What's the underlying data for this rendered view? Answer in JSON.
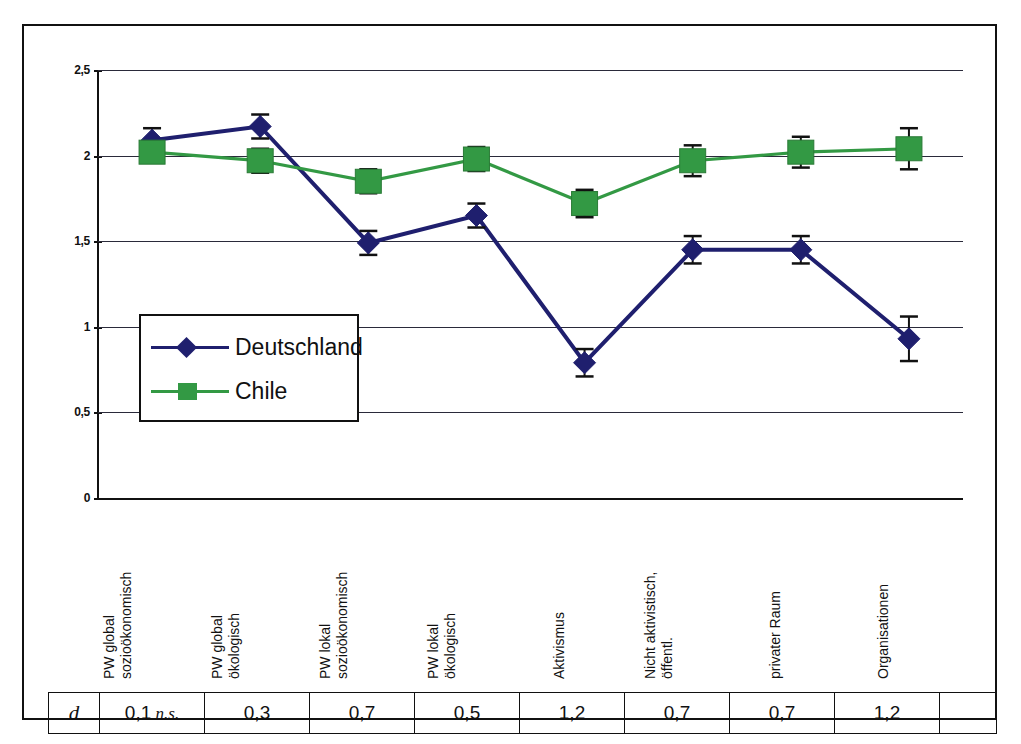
{
  "figure": {
    "background": "#ffffff",
    "frame_color": "#111111"
  },
  "legend": {
    "position": "inside-left-middle",
    "entries": [
      {
        "label": "Deutschland",
        "color": "#1F1F6E",
        "marker": "diamond"
      },
      {
        "label": "Chile",
        "color": "#339944",
        "marker": "square"
      }
    ]
  },
  "d_table": {
    "row_header": "d",
    "cells": [
      "0,1 n.s.",
      "0,3",
      "0,7",
      "0,5",
      "1,2",
      "0,7",
      "0,7",
      "1,2"
    ],
    "cell_values": [
      "0,1",
      "0,3",
      "0,7",
      "0,5",
      "1,2",
      "0,7",
      "0,7",
      "1,2"
    ],
    "cell_notes": [
      "n.s.",
      "",
      "",
      "",
      "",
      "",
      "",
      ""
    ],
    "trailing_empty_cell": ""
  },
  "chart_data": {
    "type": "line",
    "title": "",
    "subtitle": "",
    "xlabel": "",
    "ylabel": "",
    "ylim": [
      0,
      2.5
    ],
    "yticks": [
      0,
      0.5,
      1,
      1.5,
      2,
      2.5
    ],
    "ytick_labels": [
      "0",
      "0,5",
      "1",
      "1,5",
      "2",
      "2,5"
    ],
    "grid": true,
    "legend_position": "inside-left-middle",
    "categories": [
      "PW global sozioökonomisch",
      "PW global ökologisch",
      "PW lokal sozioökonomisch",
      "PW lokal ökologisch",
      "Aktivismus",
      "Nicht aktivistisch, öffentl.",
      "privater Raum",
      "Organisationen"
    ],
    "category_lines": [
      [
        "PW global",
        "sozioökonomisch"
      ],
      [
        "PW global",
        "ökologisch"
      ],
      [
        "PW lokal",
        "sozioökonomisch"
      ],
      [
        "PW lokal",
        "ökologisch"
      ],
      [
        "Aktivismus"
      ],
      [
        "Nicht aktivistisch,",
        "öffentl."
      ],
      [
        "privater Raum"
      ],
      [
        "Organisationen"
      ]
    ],
    "series": [
      {
        "name": "Deutschland",
        "color": "#1F1F6E",
        "marker": "diamond",
        "values": [
          2.09,
          2.17,
          1.49,
          1.65,
          0.79,
          1.45,
          1.45,
          0.93
        ],
        "errors": [
          0.07,
          0.07,
          0.07,
          0.07,
          0.08,
          0.08,
          0.08,
          0.13
        ]
      },
      {
        "name": "Chile",
        "color": "#339944",
        "marker": "square",
        "values": [
          2.02,
          1.97,
          1.85,
          1.98,
          1.72,
          1.97,
          2.02,
          2.04
        ],
        "errors": [
          0.06,
          0.07,
          0.07,
          0.07,
          0.08,
          0.09,
          0.09,
          0.12
        ]
      }
    ],
    "effect_sizes": {
      "symbol": "d",
      "values": [
        0.1,
        0.3,
        0.7,
        0.5,
        1.2,
        0.7,
        0.7,
        1.2
      ],
      "significance": [
        "n.s.",
        "",
        "",
        "",
        "",
        "",
        "",
        ""
      ]
    }
  }
}
